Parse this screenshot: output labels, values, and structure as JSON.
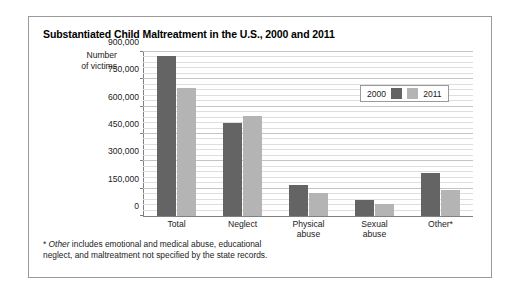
{
  "figure": {
    "title": "Substantiated Child Maltreatment in the U.S., 2000 and 2011",
    "y_axis_caption_line1": "Number",
    "y_axis_caption_line2": "of victims",
    "footnote_marker": "*",
    "footnote_italic_word": "Other",
    "footnote_rest_line1": " includes emotional and medical abuse, educational",
    "footnote_rest_line2": "neglect, and maltreatment not specified by the state records."
  },
  "legend": {
    "entries": [
      {
        "label": "2000",
        "color": "#646464"
      },
      {
        "label": "2011",
        "color": "#b4b4b4"
      }
    ]
  },
  "axis": {
    "y_ticks": [
      "900,000",
      "750,000",
      "600,000",
      "450,000",
      "300,000",
      "150,000",
      "0"
    ]
  },
  "chart_data": {
    "type": "bar",
    "title": "Substantiated Child Maltreatment in the U.S., 2000 and 2011",
    "xlabel": "",
    "ylabel": "Number of victims",
    "ylim": [
      0,
      900000
    ],
    "ytick_interval": 150000,
    "yminor_interval": 30000,
    "grid": true,
    "legend_position": "top-right-inside",
    "categories": [
      "Total",
      "Neglect",
      "Physical\nabuse",
      "Sexual\nabuse",
      "Other*"
    ],
    "category_labels": [
      {
        "line1": "Total",
        "line2": ""
      },
      {
        "line1": "Neglect",
        "line2": ""
      },
      {
        "line1": "Physical",
        "line2": "abuse"
      },
      {
        "line1": "Sexual",
        "line2": "abuse"
      },
      {
        "line1": "Other*",
        "line2": ""
      }
    ],
    "series": [
      {
        "name": "2000",
        "color": "#646464",
        "values": [
          880000,
          510000,
          170000,
          90000,
          235000
        ]
      },
      {
        "name": "2011",
        "color": "#b4b4b4",
        "values": [
          700000,
          550000,
          125000,
          65000,
          145000
        ]
      }
    ]
  }
}
